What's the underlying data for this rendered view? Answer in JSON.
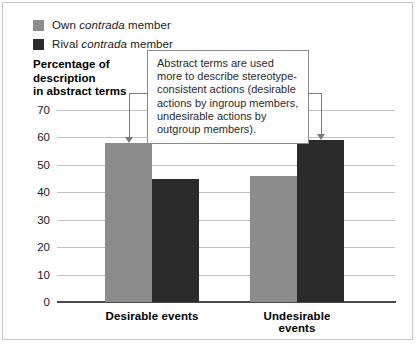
{
  "chart_data": {
    "type": "bar",
    "title": "",
    "subtitle": "",
    "categories": [
      "Desirable events",
      "Undesirable events"
    ],
    "series": [
      {
        "name": "Own contrada member",
        "values": [
          58,
          46
        ],
        "color": "#8c8c8c"
      },
      {
        "name": "Rival contrada member",
        "values": [
          45,
          59
        ],
        "color": "#2b2b2b"
      }
    ],
    "xlabel": "",
    "ylabel": "Percentage of description in abstract terms",
    "ylim": [
      0,
      70
    ],
    "yticks": [
      0,
      10,
      20,
      30,
      40,
      50,
      60,
      70
    ],
    "ytick_labels": [
      "0",
      "10",
      "20",
      "30",
      "40",
      "50",
      "60",
      "70"
    ],
    "grid": true,
    "legend_position": "top-left",
    "annotations": [
      {
        "text": "Abstract terms are used more to describe stereotype-consistent actions (desirable actions by ingroup members, undesirable actions by outgroup members).",
        "points_to": [
          "Desirable events / Own contrada member",
          "Undesirable events / Rival contrada member"
        ]
      }
    ]
  },
  "legend": {
    "items": [
      {
        "prefix": "Own ",
        "italic": "contrada",
        "suffix": " member",
        "color": "#8c8c8c"
      },
      {
        "prefix": "Rival ",
        "italic": "contrada",
        "suffix": " member",
        "color": "#2b2b2b"
      }
    ]
  },
  "axis_title": {
    "line1": "Percentage of",
    "line2": "description",
    "line3": "in abstract terms"
  },
  "yticks": {
    "t70": "70",
    "t60": "60",
    "t50": "50",
    "t40": "40",
    "t30": "30",
    "t20": "20",
    "t10": "10",
    "t0": "0"
  },
  "xlabels": {
    "group1": "Desirable events",
    "group2": "Undesirable events"
  },
  "callout": {
    "text": "Abstract terms are used more to describe stereotype-consistent actions (desirable actions by ingroup members, undesirable actions by outgroup members)."
  },
  "colors": {
    "own": "#8c8c8c",
    "rival": "#2b2b2b",
    "grid": "#c0c0c0",
    "axis": "#4a4a4a",
    "callout_border": "#8a8a8a",
    "leader": "#7a7a7a"
  }
}
